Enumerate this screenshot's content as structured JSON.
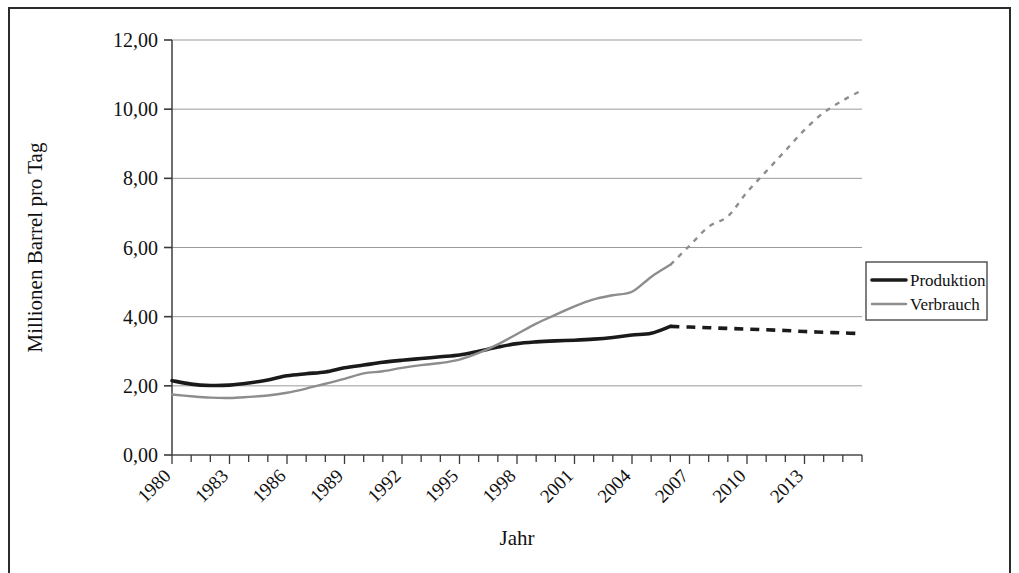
{
  "chart_data": {
    "type": "line",
    "title": "",
    "xlabel": "Jahr",
    "ylabel": "Millionen Barrel pro Tag",
    "xlim": [
      1980,
      2016
    ],
    "ylim": [
      0,
      12
    ],
    "ytick_step": 2,
    "ytick_labels": [
      "0,00",
      "2,00",
      "4,00",
      "6,00",
      "8,00",
      "10,00",
      "12,00"
    ],
    "ytick_values": [
      0,
      2,
      4,
      6,
      8,
      10,
      12
    ],
    "xtick_labels": [
      "1980",
      "1983",
      "1986",
      "1989",
      "1992",
      "1995",
      "1998",
      "2001",
      "2004",
      "2007",
      "2010",
      "2013"
    ],
    "xtick_values": [
      1980,
      1983,
      1986,
      1989,
      1992,
      1995,
      1998,
      2001,
      2004,
      2007,
      2010,
      2013
    ],
    "xtick_minor_step": 1,
    "xtick_label_rotation": -45,
    "grid": "horizontal",
    "legend_position": "right",
    "forecast_start_year": 2006,
    "x": [
      1980,
      1981,
      1982,
      1983,
      1984,
      1985,
      1986,
      1987,
      1988,
      1989,
      1990,
      1991,
      1992,
      1993,
      1994,
      1995,
      1996,
      1997,
      1998,
      1999,
      2000,
      2001,
      2002,
      2003,
      2004,
      2005,
      2006,
      2007,
      2008,
      2009,
      2010,
      2011,
      2012,
      2013,
      2014,
      2015,
      2016
    ],
    "series": [
      {
        "name": "Produktion",
        "color": "#1a1a1a",
        "width": 3.6,
        "style": "solid-then-dashed",
        "values": [
          2.15,
          2.05,
          2.01,
          2.02,
          2.08,
          2.17,
          2.29,
          2.35,
          2.4,
          2.52,
          2.6,
          2.68,
          2.74,
          2.79,
          2.84,
          2.89,
          3.0,
          3.12,
          3.22,
          3.27,
          3.3,
          3.32,
          3.35,
          3.4,
          3.47,
          3.52,
          3.72,
          3.7,
          3.68,
          3.66,
          3.64,
          3.62,
          3.6,
          3.57,
          3.55,
          3.53,
          3.51
        ]
      },
      {
        "name": "Verbrauch",
        "color": "#8d8d8d",
        "width": 2.4,
        "style": "solid-then-dashed",
        "values": [
          1.75,
          1.7,
          1.66,
          1.65,
          1.68,
          1.72,
          1.8,
          1.92,
          2.06,
          2.2,
          2.36,
          2.42,
          2.52,
          2.6,
          2.66,
          2.76,
          2.95,
          3.2,
          3.5,
          3.8,
          4.05,
          4.3,
          4.5,
          4.62,
          4.72,
          5.15,
          5.5,
          6.05,
          6.6,
          6.9,
          7.6,
          8.2,
          8.8,
          9.4,
          9.9,
          10.25,
          10.55
        ]
      }
    ]
  },
  "legend": {
    "items": [
      {
        "label": "Produktion",
        "color": "#1a1a1a"
      },
      {
        "label": "Verbrauch",
        "color": "#8d8d8d"
      }
    ]
  },
  "axes": {
    "y_title": "Millionen Barrel pro Tag",
    "x_title": "Jahr"
  }
}
